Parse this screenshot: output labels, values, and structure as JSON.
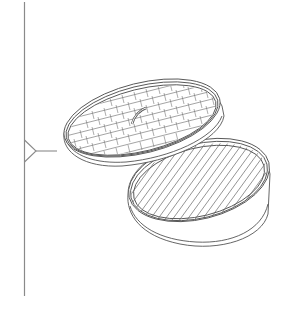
{
  "illustration": {
    "subject": "bamboo steamer with lid",
    "alt": "Line drawing of a bamboo steamer basket with its woven lid tilted above it",
    "stroke_color": "#555555",
    "guide_color": "#8a8a8a",
    "background": "#ffffff"
  },
  "pointer": {
    "icon": "pointer-arrow-icon"
  }
}
